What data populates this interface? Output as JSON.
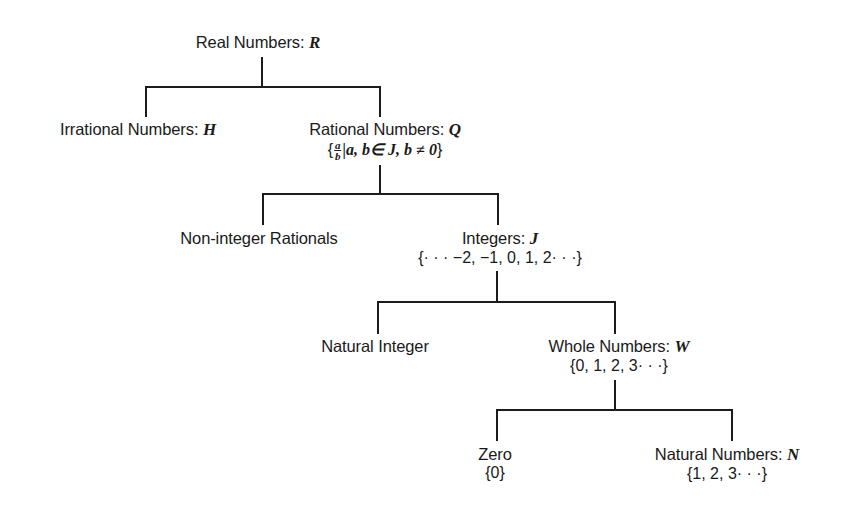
{
  "diagram": {
    "type": "tree",
    "line_color": "#1c1c1c",
    "text_color": "#1a1a1a",
    "background": "#ffffff"
  },
  "nodes": {
    "real": {
      "label": "Real Numbers: ",
      "symbol": "R"
    },
    "irrational": {
      "label": "Irrational Numbers: ",
      "symbol": "H"
    },
    "rational": {
      "label": "Rational Numbers: ",
      "symbol": "Q",
      "set_open": "{",
      "frac_num": "a",
      "frac_den": "b",
      "set_rest": "|a, b∈ J, b ≠ 0",
      "set_close": "}"
    },
    "non_integer": {
      "label": "Non-integer Rationals"
    },
    "integers": {
      "label": "Integers: ",
      "symbol": "J",
      "set": "{· · · −2, −1, 0, 1, 2· · ·}"
    },
    "natural_integer": {
      "label": "Natural Integer"
    },
    "whole": {
      "label": "Whole Numbers: ",
      "symbol": "W",
      "set": "{0, 1, 2, 3· · ·}"
    },
    "zero": {
      "label": "Zero",
      "set": "{0}"
    },
    "natural": {
      "label": "Natural Numbers: ",
      "symbol": "N",
      "set": "{1, 2, 3· · ·}"
    }
  },
  "edges": [
    {
      "from": "Real Numbers",
      "to": "Irrational Numbers"
    },
    {
      "from": "Real Numbers",
      "to": "Rational Numbers"
    },
    {
      "from": "Rational Numbers",
      "to": "Non-integer Rationals"
    },
    {
      "from": "Rational Numbers",
      "to": "Integers"
    },
    {
      "from": "Integers",
      "to": "Natural Integer"
    },
    {
      "from": "Integers",
      "to": "Whole Numbers"
    },
    {
      "from": "Whole Numbers",
      "to": "Zero"
    },
    {
      "from": "Whole Numbers",
      "to": "Natural Numbers"
    }
  ]
}
